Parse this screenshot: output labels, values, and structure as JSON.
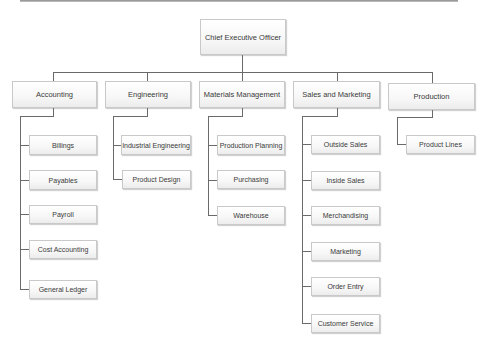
{
  "chart": {
    "root": {
      "label": "Chief Executive Officer"
    },
    "departments": [
      {
        "label": "Accounting",
        "children": [
          "Billings",
          "Payables",
          "Payroll",
          "Cost Accounting",
          "General Ledger"
        ]
      },
      {
        "label": "Engineering",
        "children": [
          "Industrial Engineering",
          "Product Design"
        ]
      },
      {
        "label": "Materials Management",
        "children": [
          "Production Planning",
          "Purchasing",
          "Warehouse"
        ]
      },
      {
        "label": "Sales and Marketing",
        "children": [
          "Outside Sales",
          "Inside Sales",
          "Merchandising",
          "Marketing",
          "Order Entry",
          "Customer Service"
        ]
      },
      {
        "label": "Production",
        "children": [
          "Product Lines"
        ]
      }
    ]
  },
  "colors": {
    "line": "#6a6a6a",
    "box_border": "#c9c9c9",
    "text": "#3a3a3a",
    "background": "#ffffff"
  }
}
